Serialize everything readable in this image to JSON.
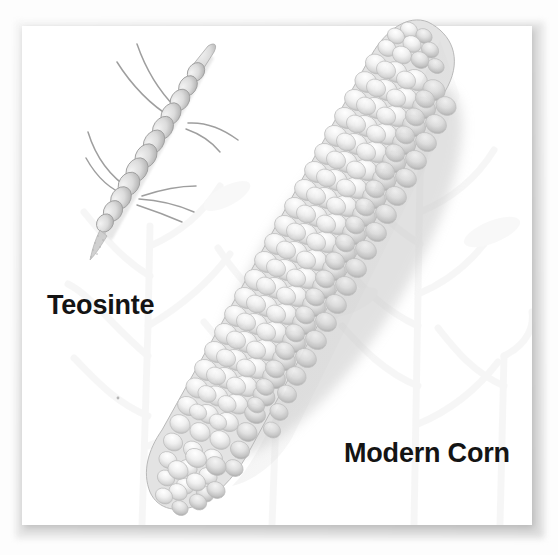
{
  "figure": {
    "canvas_width": 558,
    "canvas_height": 555,
    "background_color": "#ffffff",
    "panel_color": "#ffffff",
    "panel_border_color": "#dcdcdc",
    "label_color": "#141414"
  },
  "labels": {
    "teosinte": "Teosinte",
    "modern_corn": "Modern Corn"
  },
  "specimens": [
    {
      "name": "teosinte-ear",
      "label": "Teosinte",
      "description": "small slender segmented teosinte ear with long silks",
      "fill_color": "#cfcfcf",
      "outline_color": "#9a9a9a"
    },
    {
      "name": "modern-corn-cob",
      "label": "Modern Corn",
      "description": "large modern corn cob covered in rounded kernels",
      "fill_color": "#ececec",
      "outline_color": "#b4b4b4"
    }
  ],
  "background_watermark": {
    "name": "corn-plant-watermark",
    "description": "very faint silhouettes of corn plants and leaves",
    "color": "#f0f0f0"
  }
}
